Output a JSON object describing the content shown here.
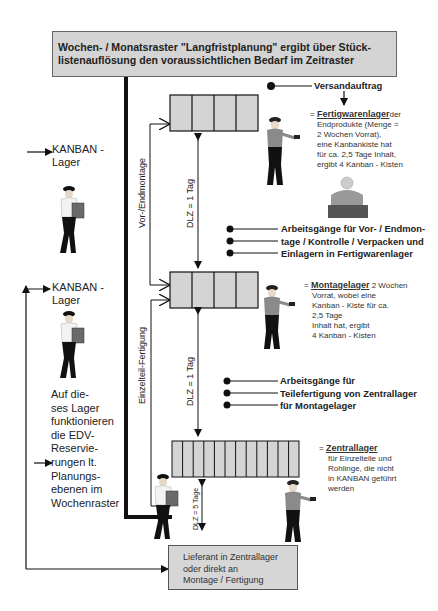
{
  "header": {
    "text_line1": "Wochen- / Monatsraster \"Langfristplanung\" ergibt über Stück-",
    "text_line2": "listenauflösung den voraussichtlichen Bedarf im Zeitraster"
  },
  "left_column": {
    "kanban_lager_1": {
      "line1": "KANBAN -",
      "line2": "Lager"
    },
    "kanban_lager_2": {
      "line1": "KANBAN -",
      "line2": "Lager"
    },
    "note_lines": [
      "Auf die-",
      "ses Lager",
      "funktionieren",
      "die EDV-",
      "Reservie-",
      "rungen lt.",
      "Planungs-",
      "ebenen im",
      "Wochenraster"
    ]
  },
  "vertical_labels": {
    "vor_endmontage": "Vor-/Endmontage",
    "einzelteil_fertigung": "Einzelteil-Fertigung",
    "dlz_top": "DLZ = 1 Tag",
    "dlz_mid": "DLZ = 1 Tag",
    "dlz_bottom": "DLZ = 5 Tage"
  },
  "versandauftrag": "Versandauftrag",
  "fertigwarenlager": {
    "prefix": "=",
    "title": "Fertigwarenlager",
    "lines": [
      "der",
      "Endprodukte (Menge =",
      "2 Wochen Vorrat),",
      "eine Kanbankiste hat",
      "für ca. 2,5 Tage Inhalt,",
      "ergibt 4 Kanban - Kisten"
    ]
  },
  "arbeitsgaenge_vor_end": [
    "Arbeitsgänge für Vor- / Endmon-",
    "tage / Kontrolle / Verpacken und",
    "Einlagern in Fertigwarenlager"
  ],
  "montagelager": {
    "prefix": "=",
    "title": "Montagelager",
    "lines": [
      "2 Wochen",
      "Vorrat, wobei eine",
      "Kanban - Kiste für ca.",
      "2,5 Tage",
      "Inhalt hat, ergibt",
      "4 Kanban - Kisten"
    ]
  },
  "arbeitsgaenge_teile": [
    "Arbeitsgänge für",
    "Teilefertigung von Zentrallager",
    "für Montagelager"
  ],
  "zentrallager": {
    "prefix": "=",
    "title": "Zentrallager",
    "lines": [
      "für Einzelteile und",
      "Rohlinge, die nicht",
      "in KANBAN geführt",
      "werden"
    ]
  },
  "supplier_box": [
    "Lieferant in Zentrallager",
    "oder direkt an",
    "Montage / Fertigung"
  ],
  "colors": {
    "box_fill": "#d4d4d4",
    "line": "#111111",
    "text": "#222222"
  }
}
